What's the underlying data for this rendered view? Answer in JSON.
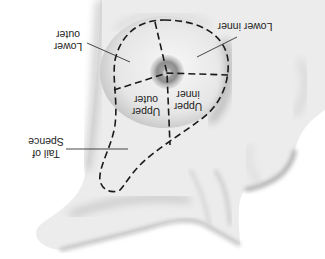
{
  "diagram": {
    "orientation": "rotated-180",
    "labels": {
      "lower_outer": [
        "Lower",
        "outer"
      ],
      "lower_inner": "Lower inner",
      "upper_outer": [
        "Upper",
        "outer"
      ],
      "upper_inner": [
        "Upper",
        "inner"
      ],
      "tail_of_spence": [
        "Tail of",
        "Spence"
      ]
    },
    "colors": {
      "line": "#1a1a1a",
      "skin_light": "#f2f2f2",
      "skin_shadow": "#9a9a9a",
      "areola": "#8a8a8a",
      "background": "#ffffff"
    }
  }
}
